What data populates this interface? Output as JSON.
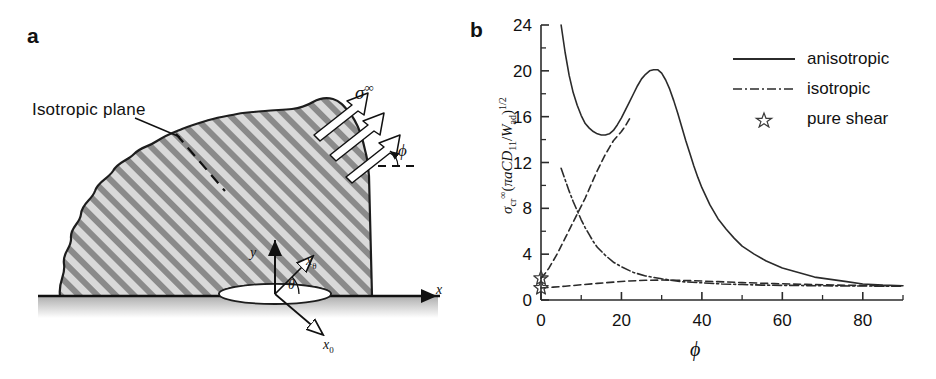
{
  "figure": {
    "panel_a": {
      "letter": "a",
      "isotropic_plane_label": "Isotropic plane",
      "stress_label": "σ",
      "stress_superscript": "∞",
      "phi_label": "ϕ",
      "axes": [
        {
          "name": "y-axis-label",
          "text": "y"
        },
        {
          "name": "x-theta-axis-label",
          "text": "x",
          "sub": "θ"
        },
        {
          "name": "theta-angle-label",
          "text": "θ"
        },
        {
          "name": "x0-axis-label",
          "text": "x",
          "sub": "0"
        },
        {
          "name": "x-axis-label",
          "text": "x"
        }
      ],
      "hatch_color": "#808080",
      "fill_color": "#d4d4d4"
    },
    "panel_b": {
      "letter": "b",
      "legend": [
        {
          "label": "anisotropic",
          "style": "solid"
        },
        {
          "label": "isotropic",
          "style": "dash-dot"
        },
        {
          "label": "pure shear",
          "style": "star"
        }
      ]
    }
  },
  "chart_data": {
    "type": "line",
    "title": "",
    "xlabel": "ϕ",
    "ylabel": "σcr∞(πaCD11/Wad)^1/2",
    "ylabel_parts": {
      "sigma": "σ",
      "sub": "cr",
      "sup": "∞",
      "open": "(",
      "pi_a_c_d": "πaCD",
      "sub11": "11",
      "slash": "/",
      "w": "W",
      "subad": "ad",
      "close": ")",
      "exp": "1/2"
    },
    "xlim": [
      0,
      90
    ],
    "ylim": [
      0,
      24
    ],
    "xticks": [
      0,
      20,
      40,
      60,
      80
    ],
    "xticks_minor_step": 10,
    "yticks": [
      0,
      4,
      8,
      12,
      16,
      20,
      24
    ],
    "yticks_minor_step": 2,
    "grid": false,
    "legend_position": "upper-right",
    "series": [
      {
        "name": "anisotropic",
        "style": "solid",
        "color": "#2b2b2b",
        "points": [
          [
            5.0,
            24.0
          ],
          [
            6.0,
            21.6
          ],
          [
            7.0,
            19.6
          ],
          [
            8.0,
            18.1
          ],
          [
            9.0,
            17.0
          ],
          [
            10.0,
            16.1
          ],
          [
            11.0,
            15.4
          ],
          [
            12.0,
            15.0
          ],
          [
            13.0,
            14.7
          ],
          [
            14.0,
            14.5
          ],
          [
            15.0,
            14.4
          ],
          [
            16.0,
            14.4
          ],
          [
            17.0,
            14.5
          ],
          [
            18.0,
            14.8
          ],
          [
            19.0,
            15.3
          ],
          [
            20.0,
            15.9
          ],
          [
            21.0,
            16.6
          ],
          [
            22.0,
            17.3
          ],
          [
            23.0,
            18.0
          ],
          [
            24.0,
            18.7
          ],
          [
            25.0,
            19.3
          ],
          [
            26.0,
            19.7
          ],
          [
            27.0,
            20.0
          ],
          [
            28.0,
            20.1
          ],
          [
            29.0,
            20.1
          ],
          [
            30.0,
            19.8
          ],
          [
            31.0,
            19.2
          ],
          [
            32.0,
            18.4
          ],
          [
            33.0,
            17.4
          ],
          [
            34.0,
            16.3
          ],
          [
            35.0,
            15.1
          ],
          [
            36.0,
            13.9
          ],
          [
            37.0,
            12.8
          ],
          [
            38.0,
            11.7
          ],
          [
            39.0,
            10.7
          ],
          [
            40.0,
            9.8
          ],
          [
            42.0,
            8.3
          ],
          [
            44.0,
            7.1
          ],
          [
            46.0,
            6.2
          ],
          [
            48.0,
            5.4
          ],
          [
            50.0,
            4.7
          ],
          [
            53.0,
            4.0
          ],
          [
            56.0,
            3.4
          ],
          [
            60.0,
            2.8
          ],
          [
            64.0,
            2.4
          ],
          [
            68.0,
            2.0
          ],
          [
            72.0,
            1.8
          ],
          [
            76.0,
            1.6
          ],
          [
            80.0,
            1.4
          ],
          [
            85.0,
            1.3
          ],
          [
            90.0,
            1.25
          ]
        ]
      },
      {
        "name": "isotropic-descending",
        "style": "dash-dot",
        "color": "#2b2b2b",
        "points": [
          [
            5.0,
            11.5
          ],
          [
            6.0,
            10.5
          ],
          [
            7.0,
            9.5
          ],
          [
            8.0,
            8.6
          ],
          [
            9.0,
            7.8
          ],
          [
            10.0,
            7.0
          ],
          [
            11.0,
            6.3
          ],
          [
            12.0,
            5.7
          ],
          [
            13.0,
            5.1
          ],
          [
            14.0,
            4.6
          ],
          [
            16.0,
            3.9
          ],
          [
            18.0,
            3.3
          ],
          [
            20.0,
            2.9
          ],
          [
            23.0,
            2.4
          ],
          [
            26.0,
            2.1
          ],
          [
            30.0,
            1.85
          ],
          [
            35.0,
            1.6
          ],
          [
            40.0,
            1.5
          ],
          [
            45.0,
            1.4
          ],
          [
            50.0,
            1.35
          ],
          [
            55.0,
            1.3
          ],
          [
            60.0,
            1.28
          ],
          [
            70.0,
            1.24
          ],
          [
            80.0,
            1.22
          ],
          [
            90.0,
            1.2
          ]
        ]
      },
      {
        "name": "anisotropic-ascending-dashed",
        "style": "dashed",
        "color": "#2b2b2b",
        "points": [
          [
            0.0,
            1.9
          ],
          [
            1.0,
            2.3
          ],
          [
            2.0,
            2.8
          ],
          [
            3.0,
            3.4
          ],
          [
            4.0,
            4.0
          ],
          [
            5.0,
            4.7
          ],
          [
            6.0,
            5.4
          ],
          [
            7.0,
            6.1
          ],
          [
            8.0,
            6.8
          ],
          [
            9.0,
            7.5
          ],
          [
            10.0,
            8.2
          ],
          [
            11.0,
            8.9
          ],
          [
            12.0,
            9.7
          ],
          [
            13.0,
            10.5
          ],
          [
            14.0,
            11.3
          ],
          [
            15.0,
            12.0
          ],
          [
            16.0,
            12.7
          ],
          [
            17.0,
            13.3
          ],
          [
            18.0,
            13.9
          ],
          [
            19.0,
            14.3
          ],
          [
            20.0,
            14.7
          ],
          [
            21.0,
            15.2
          ],
          [
            22.0,
            15.8
          ]
        ]
      },
      {
        "name": "isotropic-low-dashed",
        "style": "dashed",
        "color": "#2b2b2b",
        "points": [
          [
            0.0,
            1.05
          ],
          [
            3.0,
            1.12
          ],
          [
            6.0,
            1.2
          ],
          [
            10.0,
            1.33
          ],
          [
            14.0,
            1.45
          ],
          [
            18.0,
            1.56
          ],
          [
            22.0,
            1.66
          ],
          [
            26.0,
            1.72
          ],
          [
            30.0,
            1.74
          ],
          [
            34.0,
            1.72
          ],
          [
            38.0,
            1.68
          ],
          [
            44.0,
            1.6
          ],
          [
            50.0,
            1.52
          ],
          [
            58.0,
            1.43
          ],
          [
            66.0,
            1.36
          ],
          [
            74.0,
            1.3
          ],
          [
            82.0,
            1.26
          ],
          [
            90.0,
            1.22
          ]
        ]
      }
    ],
    "markers": [
      {
        "name": "pure-shear",
        "symbol": "star",
        "x": 0,
        "y": 1.9
      },
      {
        "name": "pure-shear",
        "symbol": "star",
        "x": 0,
        "y": 1.05
      }
    ]
  }
}
